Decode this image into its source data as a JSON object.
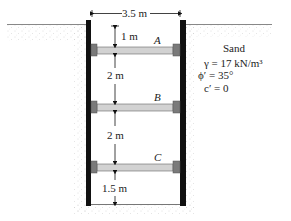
{
  "figure": {
    "width_label": "3.5 m",
    "struts": [
      {
        "label": "A",
        "spacing_above": "1 m"
      },
      {
        "label": "B",
        "spacing_above": "2 m"
      },
      {
        "label": "C",
        "spacing_above": "2 m"
      }
    ],
    "bottom_spacing": "1.5 m"
  },
  "soil": {
    "name": "Sand",
    "gamma": "γ = 17 kN/m³",
    "phi": "ϕ′ = 35°",
    "cohesion": "c′ = 0"
  },
  "colors": {
    "sheet_pile": "#111111",
    "waler": "#7a7a7a",
    "strut": "#cfcfcf",
    "ground_line": "#888888",
    "sand_dots": "#b5b5b5"
  }
}
